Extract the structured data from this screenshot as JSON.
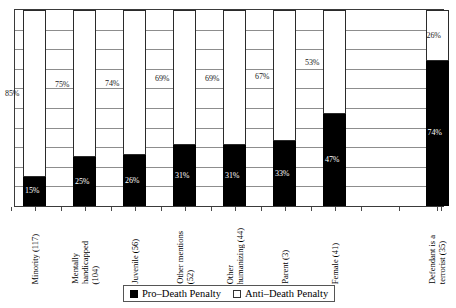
{
  "chart_data": {
    "type": "bar",
    "subtype": "stacked-bar-100pct",
    "title": "",
    "xlabel": "",
    "ylabel": "",
    "ylim": [
      0,
      100
    ],
    "grid": true,
    "grid_interval": 10,
    "y_tick_labels": [],
    "legend_position": "bottom-center",
    "categories": [
      "Minority (117)",
      "Mentally handicapped (104)",
      "Juvenile (56)",
      "Other mentions (52)",
      "Other humanizing (44)",
      "Parent (3)",
      "Female (41)",
      "Defendant is a terrorist (35)"
    ],
    "category_lines": [
      [
        "Minority (117)"
      ],
      [
        "Mentally",
        "handicapped",
        "(104)"
      ],
      [
        "Juvenile (56)"
      ],
      [
        "Other mentions",
        "(52)"
      ],
      [
        "Other",
        "humanizing (44)"
      ],
      [
        "Parent (3)"
      ],
      [
        "Female (41)"
      ],
      [
        "Defendant is a",
        "terrorist (35)"
      ]
    ],
    "series": [
      {
        "name": "Pro-Death Penalty",
        "color": "#000000",
        "values": [
          15,
          25,
          26,
          31,
          31,
          33,
          47,
          74
        ],
        "labels": [
          "15%",
          "25%",
          "26%",
          "31%",
          "31%",
          "33%",
          "47%",
          "74%"
        ]
      },
      {
        "name": "Anti-Death Penalty",
        "color": "#ffffff",
        "values": [
          85,
          75,
          74,
          69,
          69,
          67,
          53,
          26
        ],
        "labels": [
          "85%",
          "75%",
          "74%",
          "69%",
          "69%",
          "67%",
          "53%",
          "26%"
        ]
      }
    ]
  },
  "legend": {
    "items": [
      {
        "label": "Pro–Death Penalty",
        "swatch": "black-square-icon"
      },
      {
        "label": "Anti–Death Penalty",
        "swatch": "white-square-icon"
      }
    ]
  }
}
